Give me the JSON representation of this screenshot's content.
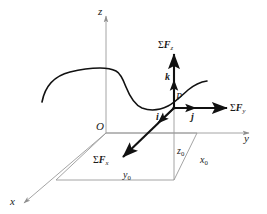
{
  "figure": {
    "type": "3d-vector-diagram",
    "title_visible": false,
    "background": "#ffffff",
    "stroke_axes": "#9a9a9a",
    "stroke_vectors": "#111111",
    "stroke_curve": "#111111",
    "width": 267,
    "height": 214
  },
  "axes": {
    "z_label": "z",
    "y_label": "y",
    "x_label": "x",
    "origin_label": "O"
  },
  "point": {
    "label": "P"
  },
  "unit_vectors": {
    "i": "i",
    "j": "j",
    "k": "k"
  },
  "forces": {
    "sum_fz": {
      "sigma": "Σ",
      "f": "F",
      "sub": "z"
    },
    "sum_fy": {
      "sigma": "Σ",
      "f": "F",
      "sub": "y"
    },
    "sum_fx": {
      "sigma": "Σ",
      "f": "F",
      "sub": "x"
    }
  },
  "coordinates": {
    "x0": {
      "base": "x",
      "sub": "0"
    },
    "y0": {
      "base": "y",
      "sub": "0"
    },
    "z0": {
      "base": "z",
      "sub": "0"
    }
  }
}
